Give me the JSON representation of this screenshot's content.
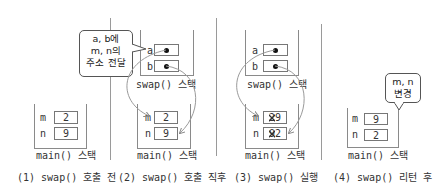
{
  "panels": [
    {
      "caption": "(1) swap() 호출 전",
      "main_stack": {
        "label": "main() 스택",
        "vars": [
          {
            "name": "m",
            "value": "2"
          },
          {
            "name": "n",
            "value": "9"
          }
        ]
      }
    },
    {
      "caption": "(2) swap() 호출 직후",
      "callout": [
        "a, b에",
        "m, n의",
        "주소 전달"
      ],
      "swap_stack": {
        "label": "swap() 스택",
        "vars": [
          {
            "name": "a",
            "value": "•"
          },
          {
            "name": "b",
            "value": "•"
          }
        ]
      },
      "main_stack": {
        "label": "main() 스택",
        "vars": [
          {
            "name": "m",
            "value": "2"
          },
          {
            "name": "n",
            "value": "9"
          }
        ]
      }
    },
    {
      "caption": "(3) swap() 실행",
      "swap_stack": {
        "label": "swap() 스택",
        "vars": [
          {
            "name": "a",
            "value": "•"
          },
          {
            "name": "b",
            "value": "•"
          }
        ]
      },
      "main_stack": {
        "label": "main() 스택",
        "vars": [
          {
            "name": "m",
            "old_value": "2",
            "value": "9"
          },
          {
            "name": "n",
            "old_value": "9",
            "value": "2"
          }
        ]
      }
    },
    {
      "caption": "(4) swap() 리턴 후",
      "callout": [
        "m, n",
        "변경"
      ],
      "main_stack": {
        "label": "main() 스택",
        "vars": [
          {
            "name": "m",
            "value": "9"
          },
          {
            "name": "n",
            "value": "2"
          }
        ]
      }
    }
  ],
  "colors": {
    "line": "#8a8a8a",
    "arrow": "#9a9a9a",
    "text": "#333333"
  }
}
